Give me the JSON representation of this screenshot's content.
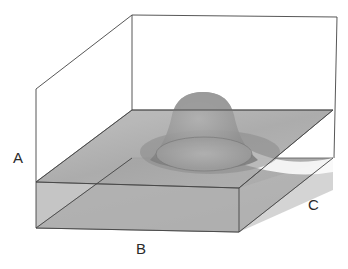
{
  "figure": {
    "labels": {
      "a": "A",
      "b": "B",
      "c": "C"
    },
    "colors": {
      "line": "#4a4a4a",
      "plane_fill": "#a8a8a8",
      "plane_fill_dark": "#8e8e8e",
      "dome_fill": "#9a9a9a",
      "background": "#ffffff"
    }
  }
}
